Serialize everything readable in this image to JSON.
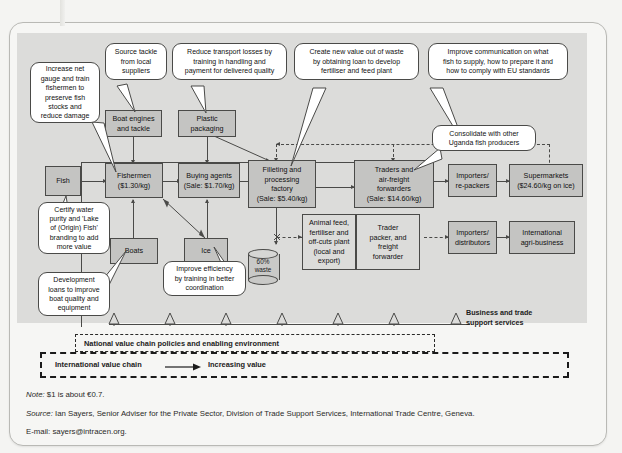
{
  "diagram": {
    "colors": {
      "plate": "#dcdcda",
      "box_fill": "#c4c4c2",
      "box_border": "#4a4a48",
      "callout_fill": "#ffffff",
      "page_bg": "#f6f6f4"
    },
    "nodes": [
      {
        "id": "fish",
        "label": "Fish"
      },
      {
        "id": "boat_engines",
        "label": "Boat engines\nand tackle"
      },
      {
        "id": "plastic",
        "label": "Plastic\npackaging"
      },
      {
        "id": "fishermen",
        "label": "Fishermen\n($1.30/kg)"
      },
      {
        "id": "buying_agents",
        "label": "Buying agents\n(Sale: $1.70/kg)"
      },
      {
        "id": "filleting",
        "label": "Filleting and\nprocessing\nfactory\n(Sale: $5.40/kg)"
      },
      {
        "id": "traders",
        "label": "Traders and\nair-freight\nforwarders\n(Sale: $14.60/kg)"
      },
      {
        "id": "importers_rp",
        "label": "Importers/\nre-packers"
      },
      {
        "id": "supermarkets",
        "label": "Supermarkets\n($24.60/kg on ice)"
      },
      {
        "id": "boats",
        "label": "Boats"
      },
      {
        "id": "ice",
        "label": "Ice"
      },
      {
        "id": "animal_feed",
        "label": "Animal feed,\nfertiliser and\noff-cuts plant\n(local and\nexport)"
      },
      {
        "id": "trader_packer",
        "label": "Trader\npacker, and\nfreight\nforwarder"
      },
      {
        "id": "importers_ds",
        "label": "Importers/\ndistributors"
      },
      {
        "id": "agri_business",
        "label": "International\nagri-business"
      }
    ],
    "callouts": [
      {
        "id": "net_gauge",
        "text": "Increase net\ngauge and train\nfishermen to\npreserve fish\nstocks and\nreduce damage"
      },
      {
        "id": "source_tackle",
        "text": "Source tackle\nfrom local\nsuppliers"
      },
      {
        "id": "transport",
        "text": "Reduce transport losses by\ntraining in handling and\npayment for delivered quality"
      },
      {
        "id": "waste_value",
        "text": "Create new value out of waste\nby obtaining loan to develop\nfertiliser and feed plant"
      },
      {
        "id": "communication",
        "text": "Improve communication on what\nfish to supply, how to prepare it and\nhow to comply with EU standards"
      },
      {
        "id": "consolidate",
        "text": "Consolidate with other\nUganda fish producers"
      },
      {
        "id": "certify",
        "text": "Certify water\npurity and 'Lake\nof (Origin) Fish'\nbranding to add\nmore value"
      },
      {
        "id": "dev_loans",
        "text": "Development\nloans to improve\nboat quality and\nequipment"
      },
      {
        "id": "efficiency",
        "text": "Improve efficiency\nby training in better\ncoordination"
      }
    ],
    "waste": {
      "label": "60%\nwaste",
      "percent": "60%"
    },
    "support_services_label": "Business and trade\nsupport services",
    "support_marker_count": 7,
    "national_band_label": "National value chain policies and enabling environment",
    "international_label": "International value chain",
    "increasing_value_label": "Increasing value"
  },
  "footnotes": {
    "note_prefix": "Note:",
    "note_text": " $1 is about €0.7.",
    "source_prefix": "Source:",
    "source_text": " Ian Sayers, Senior Adviser for the Private Sector, Division of Trade Support Services, International Trade Centre, Geneva.",
    "email_text": "E-mail: sayers@intracen.org."
  }
}
